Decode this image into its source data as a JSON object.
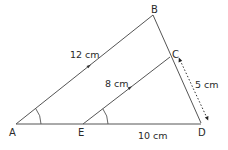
{
  "figure": {
    "vertices": {
      "A": "A",
      "B": "B",
      "C": "C",
      "D": "D",
      "E": "E"
    },
    "lengths": {
      "AB": "12 cm",
      "EC": "8 cm",
      "CD": "5 cm",
      "ED": "10 cm"
    },
    "colors": {
      "line": "#555555",
      "text": "#2a2a2a",
      "background": "#ffffff"
    }
  }
}
